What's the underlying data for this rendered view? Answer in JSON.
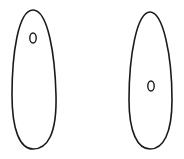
{
  "canvas": {
    "width": 184,
    "height": 159,
    "background": "#ffffff"
  },
  "stroke_color": "#1a1a1a",
  "shapes": [
    {
      "name": "left-cell",
      "description": "elongated teardrop outline with small oval near top",
      "outline_path": "M33 10 C18 10 12 55 12 95 C12 130 20 149 33 149 C47 149 57 135 56 95 C55 55 48 10 33 10 Z",
      "inner_oval": {
        "cx": 33,
        "cy": 38,
        "rx": 3.2,
        "ry": 5
      }
    },
    {
      "name": "right-cell",
      "description": "elongated teardrop outline with small oval at middle",
      "outline_path": "M150 12 C137 12 129 55 129 100 C129 133 138 149 150 149 C163 149 172 134 172 100 C172 55 163 12 150 12 Z",
      "inner_oval": {
        "cx": 151,
        "cy": 86,
        "rx": 3.2,
        "ry": 5
      }
    }
  ]
}
